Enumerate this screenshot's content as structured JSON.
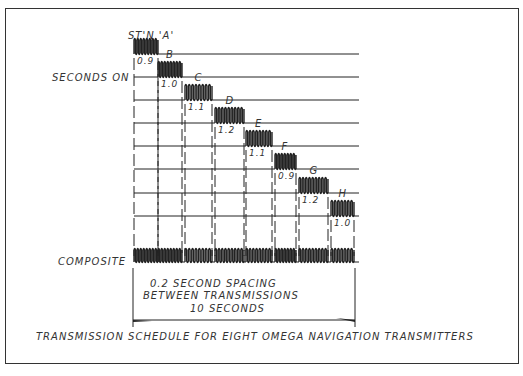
{
  "diagram": {
    "caption": "TRANSMISSION SCHEDULE FOR EIGHT OMEGA NAVIGATION TRANSMITTERS",
    "labels": {
      "station_a": "ST'N 'A'",
      "seconds_on": "SECONDS ON",
      "composite": "COMPOSITE",
      "spacing_line1": "0.2 SECOND SPACING",
      "spacing_line2": "BETWEEN TRANSMISSIONS",
      "period": "10 SECONDS"
    },
    "stations": [
      {
        "name": "A",
        "seconds_on": "0.9",
        "x0": 134,
        "x1": 158,
        "y": 54
      },
      {
        "name": "B",
        "seconds_on": "1.0",
        "x0": 158,
        "x1": 182,
        "y": 77
      },
      {
        "name": "C",
        "seconds_on": "1.1",
        "x0": 185,
        "x1": 212,
        "y": 100
      },
      {
        "name": "D",
        "seconds_on": "1.2",
        "x0": 215,
        "x1": 244,
        "y": 123
      },
      {
        "name": "E",
        "seconds_on": "1.1",
        "x0": 246,
        "x1": 272,
        "y": 146
      },
      {
        "name": "F",
        "seconds_on": "0.9",
        "x0": 275,
        "x1": 296,
        "y": 169
      },
      {
        "name": "G",
        "seconds_on": "1.2",
        "x0": 299,
        "x1": 328,
        "y": 193
      },
      {
        "name": "H",
        "seconds_on": "1.0",
        "x0": 331,
        "x1": 354,
        "y": 216
      }
    ],
    "composite_y": 262,
    "line_start_x": 134,
    "line_end_x": 359,
    "stroke_color": "#222222"
  }
}
